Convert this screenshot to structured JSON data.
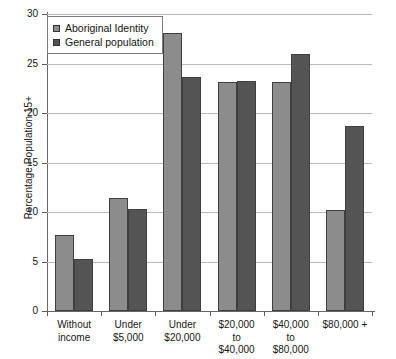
{
  "chart_data": {
    "type": "bar",
    "title": "",
    "xlabel": "",
    "ylabel": "Percentage Population 15+",
    "ylim": [
      0,
      30
    ],
    "yticks": [
      0,
      5,
      10,
      15,
      20,
      25,
      30
    ],
    "ytick_labels": [
      "0",
      "5",
      "10",
      "15",
      "20",
      "25",
      "30"
    ],
    "grid": true,
    "legend_position": "upper-left-inside",
    "categories": [
      "Without income",
      "Under $5,000",
      "Under $20,000",
      "$20,000 to $40,000",
      "$40,000 to $80,000",
      "$80,000 +"
    ],
    "category_label_lines": [
      [
        "Without",
        "income"
      ],
      [
        "Under",
        "$5,000"
      ],
      [
        "Under",
        "$20,000"
      ],
      [
        "$20,000",
        "to",
        "$40,000"
      ],
      [
        "$40,000",
        "to",
        "$80,000"
      ],
      [
        "$80,000 +"
      ]
    ],
    "series": [
      {
        "name": "Aboriginal Identity",
        "color": "#8c8c8c",
        "values": [
          7.7,
          11.4,
          28.1,
          23.1,
          23.1,
          10.2
        ]
      },
      {
        "name": "General population",
        "color": "#545454",
        "values": [
          5.3,
          10.3,
          23.6,
          23.2,
          26.0,
          18.7
        ]
      }
    ]
  },
  "legend": {
    "items": [
      {
        "label": "Aboriginal Identity",
        "series": "a"
      },
      {
        "label": "General population",
        "series": "b"
      }
    ]
  }
}
